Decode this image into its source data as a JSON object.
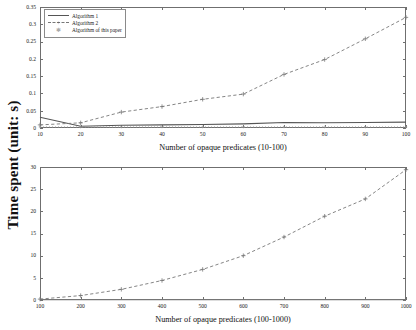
{
  "figure": {
    "ylabel": "Time spent (unit: s)",
    "background": "#ffffff",
    "axis_color": "#6f6f6f"
  },
  "legend": {
    "position": "top-left",
    "items": [
      {
        "label": "Algorithm 1",
        "style": "solid-line",
        "marker": "none",
        "color": "#555555"
      },
      {
        "label": "Algorithm 2",
        "style": "dashed-line",
        "marker": "plus",
        "color": "#777777"
      },
      {
        "label": "Algorithm of this paper",
        "style": "dotted-line",
        "marker": "star",
        "color": "#999999"
      }
    ]
  },
  "chart_data": [
    {
      "type": "line",
      "title": "",
      "xlabel": "Number of opaque predicates (10-100)",
      "ylabel": "Time spent (unit: s)",
      "x": [
        10,
        20,
        30,
        40,
        50,
        60,
        70,
        80,
        90,
        100
      ],
      "xticklabels": [
        "10",
        "20",
        "30",
        "40",
        "50",
        "60",
        "70",
        "80",
        "90",
        "100"
      ],
      "yticks": [
        0,
        0.05,
        0.1,
        0.15,
        0.2,
        0.25,
        0.3,
        0.35
      ],
      "yticklabels": [
        "0",
        "0.05",
        "0.1",
        "0.15",
        "0.2",
        "0.25",
        "0.3",
        "0.35"
      ],
      "xlim": [
        10,
        100
      ],
      "ylim": [
        0,
        0.35
      ],
      "grid": false,
      "series": [
        {
          "name": "Algorithm 1",
          "style": "solid-line",
          "marker": "none",
          "color": "#555555",
          "values": [
            0.031,
            0.005,
            0.008,
            0.009,
            0.01,
            0.012,
            0.016,
            0.015,
            0.016,
            0.017
          ]
        },
        {
          "name": "Algorithm 2",
          "style": "dashed-line",
          "marker": "plus",
          "color": "#777777",
          "values": [
            0.009,
            0.015,
            0.046,
            0.062,
            0.083,
            0.098,
            0.155,
            0.198,
            0.258,
            0.32
          ]
        },
        {
          "name": "Algorithm of this paper",
          "style": "dotted-line",
          "marker": "star",
          "color": "#999999",
          "values": [
            0.003,
            0.003,
            0.003,
            0.003,
            0.003,
            0.003,
            0.003,
            0.003,
            0.003,
            0.003
          ]
        }
      ]
    },
    {
      "type": "line",
      "title": "",
      "xlabel": "Number of opaque predicates (100-1000)",
      "ylabel": "Time spent (unit: s)",
      "x": [
        100,
        200,
        300,
        400,
        500,
        600,
        700,
        800,
        900,
        1000
      ],
      "xticklabels": [
        "100",
        "200",
        "300",
        "400",
        "500",
        "600",
        "700",
        "800",
        "900",
        "1000"
      ],
      "yticks": [
        0,
        5,
        10,
        15,
        20,
        25,
        30
      ],
      "yticklabels": [
        "0",
        "5",
        "10",
        "15",
        "20",
        "25",
        "30"
      ],
      "xlim": [
        100,
        1000
      ],
      "ylim": [
        0,
        30
      ],
      "grid": false,
      "series": [
        {
          "name": "Algorithm 2",
          "style": "dashed-line",
          "marker": "plus",
          "color": "#777777",
          "values": [
            0.2,
            1.0,
            2.4,
            4.4,
            6.9,
            10.0,
            14.2,
            18.9,
            22.8,
            29.4
          ]
        },
        {
          "name": "Algorithm of this paper",
          "style": "solid-line",
          "marker": "none",
          "color": "#777777",
          "values": [
            0.05,
            0.05,
            0.05,
            0.05,
            0.05,
            0.05,
            0.05,
            0.05,
            0.05,
            0.05
          ]
        }
      ]
    }
  ]
}
